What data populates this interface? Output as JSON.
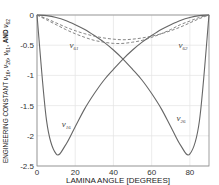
{
  "chart_data": {
    "type": "line",
    "title": "",
    "xlabel": "LAMINA ANGLE [DEGREES]",
    "ylabel": "ENGINEERING CONSTANT ν16, ν26, ν61, ν62 AND ν62",
    "xlim": [
      0,
      90
    ],
    "ylim": [
      -2.5,
      0
    ],
    "xticks": [
      0,
      20,
      40,
      60,
      80
    ],
    "yticks": [
      0,
      -0.5,
      -1,
      -1.5,
      -2,
      -2.5
    ],
    "xtick_labels": [
      "0",
      "20",
      "40",
      "60",
      "80"
    ],
    "ytick_labels": [
      "0",
      "-0.5",
      "-1",
      "-1.5",
      "-2",
      "-2.5"
    ],
    "grid": true,
    "legend": "none (inline curve labels)",
    "x": [
      0,
      5,
      10,
      15,
      20,
      25,
      30,
      35,
      40,
      45,
      50,
      55,
      60,
      65,
      70,
      75,
      80,
      85,
      90
    ],
    "series": [
      {
        "name": "ν16",
        "style": "solid",
        "values": [
          0,
          -1.75,
          -2.3,
          -2.15,
          -1.85,
          -1.55,
          -1.3,
          -1.08,
          -0.9,
          -0.73,
          -0.58,
          -0.45,
          -0.34,
          -0.24,
          -0.16,
          -0.09,
          -0.04,
          -0.01,
          0
        ]
      },
      {
        "name": "ν26",
        "style": "solid",
        "values": [
          0,
          -0.01,
          -0.04,
          -0.09,
          -0.16,
          -0.24,
          -0.34,
          -0.45,
          -0.58,
          -0.73,
          -0.9,
          -1.08,
          -1.3,
          -1.55,
          -1.85,
          -2.15,
          -2.3,
          -1.75,
          0
        ]
      },
      {
        "name": "ν61",
        "style": "dashed",
        "values": [
          0,
          -0.08,
          -0.16,
          -0.24,
          -0.31,
          -0.37,
          -0.42,
          -0.45,
          -0.47,
          -0.47,
          -0.45,
          -0.42,
          -0.37,
          -0.31,
          -0.24,
          -0.16,
          -0.1,
          -0.04,
          0
        ]
      },
      {
        "name": "ν62",
        "style": "dashed",
        "values": [
          0,
          -0.06,
          -0.13,
          -0.2,
          -0.26,
          -0.31,
          -0.35,
          -0.38,
          -0.4,
          -0.41,
          -0.4,
          -0.38,
          -0.35,
          -0.31,
          -0.26,
          -0.2,
          -0.13,
          -0.06,
          0
        ]
      }
    ],
    "annotations": [
      {
        "text": "ν61",
        "x": 17,
        "y": -0.55
      },
      {
        "text": "ν62",
        "x": 74,
        "y": -0.55
      },
      {
        "text": "ν16",
        "x": 13,
        "y": -1.85
      },
      {
        "text": "ν26",
        "x": 73,
        "y": -1.75
      }
    ]
  },
  "labels": {
    "xlabel": "LAMINA ANGLE [DEGREES]",
    "ylabel_main": "ENGINEERING CONSTANT ",
    "ylabel_tail": "AND "
  }
}
